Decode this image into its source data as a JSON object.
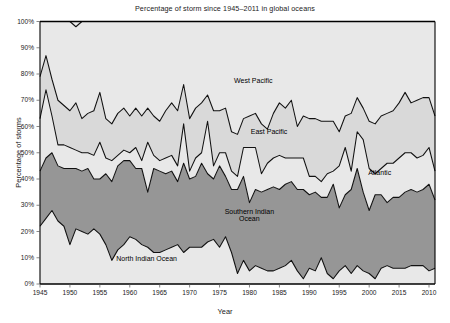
{
  "chart_data": {
    "type": "area",
    "title": "Percentage of storm since 1945–2011 in global oceans",
    "xlabel": "Year",
    "ylabel": "Percentage of storms",
    "ylim": [
      0,
      100
    ],
    "xlim": [
      1945,
      2011
    ],
    "grid": true,
    "stacked": true,
    "legend_position": "inline-labels",
    "ytick_labels": [
      "0%",
      "10%",
      "20%",
      "30%",
      "40%",
      "50%",
      "60%",
      "70%",
      "80%",
      "90%",
      "100%"
    ],
    "ytick_values": [
      0,
      10,
      20,
      30,
      40,
      50,
      60,
      70,
      80,
      90,
      100
    ],
    "xtick_labels": [
      "1945",
      "1950",
      "1955",
      "1960",
      "1965",
      "1970",
      "1975",
      "1980",
      "1985",
      "1990",
      "1995",
      "2000",
      "2015",
      "2010"
    ],
    "xtick_values": [
      1945,
      1950,
      1955,
      1960,
      1965,
      1970,
      1975,
      1980,
      1985,
      1990,
      1995,
      2000,
      2005,
      2010
    ],
    "x": [
      1945,
      1946,
      1947,
      1948,
      1949,
      1950,
      1951,
      1952,
      1953,
      1954,
      1955,
      1956,
      1957,
      1958,
      1959,
      1960,
      1961,
      1962,
      1963,
      1964,
      1965,
      1966,
      1967,
      1968,
      1969,
      1970,
      1971,
      1972,
      1973,
      1974,
      1975,
      1976,
      1977,
      1978,
      1979,
      1980,
      1981,
      1982,
      1983,
      1984,
      1985,
      1986,
      1987,
      1988,
      1989,
      1990,
      1991,
      1992,
      1993,
      1994,
      1995,
      1996,
      1997,
      1998,
      1999,
      2000,
      2001,
      2002,
      2003,
      2004,
      2005,
      2006,
      2007,
      2008,
      2009,
      2010,
      2011
    ],
    "series": [
      {
        "name": "North Indian Ocean",
        "color": "#e8e8e8",
        "values": [
          22,
          25,
          28,
          24,
          22,
          15,
          21,
          20,
          19,
          21,
          19,
          15,
          9,
          13,
          15,
          18,
          17,
          15,
          14,
          12,
          12,
          13,
          14,
          15,
          12,
          14,
          14,
          14,
          16,
          17,
          14,
          18,
          12,
          4,
          9,
          5,
          7,
          6,
          5,
          5,
          6,
          7,
          9,
          5,
          2,
          6,
          5,
          10,
          4,
          2,
          5,
          7,
          4,
          7,
          5,
          4,
          2,
          6,
          7,
          6,
          6,
          6,
          7,
          7,
          7,
          5,
          6
        ]
      },
      {
        "name": "Southern Indian Ocean",
        "color": "#969696",
        "values": [
          21,
          23,
          22,
          21,
          22,
          29,
          23,
          23,
          25,
          19,
          21,
          27,
          30,
          32,
          32,
          29,
          27,
          29,
          21,
          32,
          31,
          29,
          29,
          24,
          34,
          26,
          27,
          32,
          26,
          23,
          31,
          23,
          24,
          32,
          32,
          26,
          29,
          29,
          31,
          32,
          30,
          31,
          30,
          31,
          34,
          28,
          30,
          23,
          29,
          36,
          24,
          27,
          32,
          37,
          30,
          24,
          32,
          28,
          24,
          27,
          27,
          29,
          29,
          28,
          29,
          33,
          26
        ]
      },
      {
        "name": "Atlantic",
        "color": "#e8e8e8",
        "values": [
          20,
          26,
          14,
          8,
          9,
          8,
          7,
          7,
          6,
          9,
          14,
          6,
          8,
          4,
          4,
          3,
          8,
          3,
          19,
          5,
          4,
          6,
          6,
          6,
          15,
          3,
          7,
          4,
          20,
          5,
          5,
          9,
          7,
          5,
          11,
          21,
          16,
          7,
          10,
          11,
          13,
          10,
          9,
          12,
          12,
          7,
          6,
          6,
          9,
          5,
          16,
          18,
          7,
          14,
          20,
          16,
          8,
          10,
          15,
          13,
          15,
          15,
          14,
          13,
          13,
          14,
          11
        ]
      },
      {
        "name": "East Pacific",
        "color": "#d9d9d9",
        "values": [
          16,
          13,
          14,
          17,
          15,
          14,
          18,
          13,
          15,
          17,
          19,
          15,
          14,
          16,
          16,
          14,
          15,
          17,
          13,
          15,
          15,
          18,
          20,
          21,
          15,
          20,
          19,
          19,
          10,
          21,
          16,
          17,
          15,
          16,
          11,
          12,
          13,
          19,
          13,
          17,
          20,
          19,
          22,
          12,
          16,
          22,
          22,
          23,
          20,
          19,
          13,
          12,
          22,
          13,
          12,
          18,
          19,
          20,
          19,
          20,
          21,
          23,
          19,
          22,
          22,
          19,
          21
        ]
      },
      {
        "name": "West Pacific",
        "color": "#e8e8e8",
        "values": [
          21,
          13,
          22,
          30,
          32,
          34,
          29,
          37,
          35,
          34,
          27,
          37,
          39,
          35,
          33,
          36,
          33,
          36,
          33,
          36,
          38,
          34,
          31,
          34,
          24,
          37,
          33,
          31,
          28,
          34,
          34,
          33,
          42,
          43,
          37,
          36,
          35,
          39,
          41,
          35,
          31,
          33,
          30,
          40,
          36,
          37,
          37,
          38,
          38,
          38,
          42,
          36,
          35,
          29,
          33,
          38,
          39,
          36,
          35,
          34,
          31,
          27,
          31,
          30,
          29,
          29,
          36
        ]
      }
    ],
    "series_labels": [
      {
        "name": "West Pacific",
        "x_pct": 54,
        "y_pct": 77
      },
      {
        "name": "East Pacific",
        "x_pct": 58,
        "y_pct": 57.5
      },
      {
        "name": "Atlantic",
        "x_pct": 86,
        "y_pct": 42
      },
      {
        "name": "Southern Indian Ocean",
        "x_pct": 53,
        "y_pct": 27
      },
      {
        "name": "North Indian Ocean",
        "x_pct": 27,
        "y_pct": 9
      }
    ]
  },
  "caption": {
    "text": ""
  }
}
